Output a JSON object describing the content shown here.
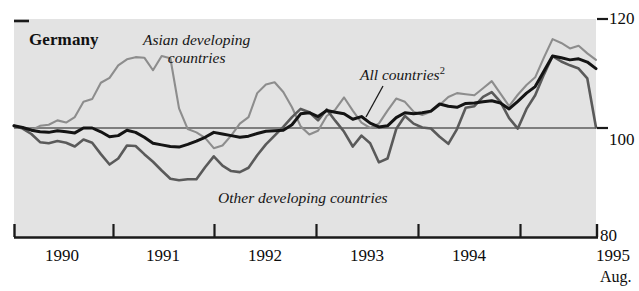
{
  "panel": {
    "title": "Germany"
  },
  "axes": {
    "y_ticks": [
      "120",
      "100",
      "80"
    ],
    "y_min": 80,
    "y_max": 120,
    "x_tick_labels": [
      "1990",
      "1991",
      "1992",
      "1993",
      "1994",
      "1995"
    ],
    "x_end_note": "Aug."
  },
  "labels": {
    "asian_line1": "Asian developing",
    "asian_line2": "countries",
    "all_countries": "All countries",
    "all_countries_footnote": "2",
    "other_developing": "Other developing countries"
  },
  "colors": {
    "plot_background": "#e3e3e3",
    "page_background": "#ffffff",
    "axis": "#1a1a1a",
    "asian_developing": "#8d8d8d",
    "other_developing": "#5a5a5a",
    "all_countries": "#141414"
  },
  "chart_data": {
    "type": "line",
    "title": "Germany",
    "xlabel": "",
    "ylabel": "",
    "ylim": [
      80,
      120
    ],
    "grid": false,
    "reference_line": 100,
    "legend": "inline-annotations",
    "x": [
      "1990-01",
      "1990-02",
      "1990-03",
      "1990-04",
      "1990-05",
      "1990-06",
      "1990-07",
      "1990-08",
      "1990-09",
      "1990-10",
      "1990-11",
      "1990-12",
      "1991-01",
      "1991-02",
      "1991-03",
      "1991-04",
      "1991-05",
      "1991-06",
      "1991-07",
      "1991-08",
      "1991-09",
      "1991-10",
      "1991-11",
      "1991-12",
      "1992-01",
      "1992-02",
      "1992-03",
      "1992-04",
      "1992-05",
      "1992-06",
      "1992-07",
      "1992-08",
      "1992-09",
      "1992-10",
      "1992-11",
      "1992-12",
      "1993-01",
      "1993-02",
      "1993-03",
      "1993-04",
      "1993-05",
      "1993-06",
      "1993-07",
      "1993-08",
      "1993-09",
      "1993-10",
      "1993-11",
      "1993-12",
      "1994-01",
      "1994-02",
      "1994-03",
      "1994-04",
      "1994-05",
      "1994-06",
      "1994-07",
      "1994-08",
      "1994-09",
      "1994-10",
      "1994-11",
      "1994-12",
      "1995-01",
      "1995-02",
      "1995-03",
      "1995-04",
      "1995-05",
      "1995-06",
      "1995-07",
      "1995-08"
    ],
    "series": [
      {
        "name": "Asian developing countries",
        "color": "#8d8d8d",
        "width": 2.1,
        "values": [
          100.3,
          100.0,
          99.6,
          100.4,
          100.6,
          101.4,
          101.0,
          102.0,
          104.8,
          105.3,
          108.3,
          109.2,
          111.5,
          112.6,
          113.0,
          112.9,
          110.6,
          113.2,
          112.8,
          103.6,
          99.8,
          99.2,
          98.2,
          96.3,
          96.8,
          98.6,
          100.8,
          102.0,
          106.4,
          108.0,
          108.4,
          106.6,
          103.8,
          100.3,
          98.8,
          99.5,
          102.2,
          103.4,
          105.6,
          103.2,
          101.0,
          100.0,
          100.8,
          103.2,
          105.4,
          104.8,
          103.0,
          102.4,
          103.0,
          104.2,
          105.7,
          106.4,
          106.2,
          106.0,
          107.3,
          108.6,
          106.3,
          104.0,
          106.1,
          107.9,
          109.3,
          112.9,
          116.3,
          115.6,
          114.6,
          115.1,
          113.7,
          112.5
        ]
      },
      {
        "name": "Other developing countries",
        "color": "#5a5a5a",
        "width": 2.6,
        "values": [
          100.4,
          99.9,
          98.9,
          97.4,
          97.2,
          97.6,
          97.3,
          96.6,
          97.9,
          97.3,
          95.2,
          93.3,
          94.4,
          96.8,
          96.7,
          95.2,
          93.8,
          92.2,
          90.7,
          90.4,
          90.6,
          90.6,
          92.8,
          94.8,
          93.1,
          92.1,
          91.9,
          92.7,
          95.0,
          97.0,
          98.6,
          100.2,
          102.0,
          103.5,
          102.9,
          101.4,
          103.4,
          101.3,
          99.3,
          96.6,
          98.6,
          97.2,
          93.7,
          94.4,
          99.8,
          102.2,
          100.8,
          100.1,
          99.9,
          98.4,
          97.1,
          99.8,
          103.7,
          104.0,
          105.7,
          106.6,
          104.8,
          101.8,
          99.9,
          103.5,
          106.0,
          109.8,
          113.2,
          112.2,
          111.5,
          110.9,
          109.1,
          100.1
        ]
      },
      {
        "name": "All countries",
        "color": "#141414",
        "width": 3.0,
        "values": [
          100.4,
          100.1,
          99.6,
          99.3,
          99.2,
          99.5,
          99.3,
          99.1,
          100.0,
          100.0,
          99.3,
          98.4,
          98.6,
          99.6,
          99.2,
          98.3,
          97.2,
          96.9,
          96.6,
          96.5,
          97.0,
          97.6,
          98.3,
          99.2,
          98.9,
          98.6,
          98.3,
          98.5,
          99.0,
          99.4,
          99.5,
          99.6,
          100.6,
          102.6,
          102.8,
          102.1,
          103.2,
          102.9,
          102.6,
          101.6,
          102.1,
          100.9,
          100.2,
          100.4,
          101.9,
          102.8,
          102.6,
          102.8,
          103.1,
          104.4,
          104.0,
          103.8,
          104.5,
          104.6,
          104.8,
          105.0,
          104.6,
          103.5,
          104.9,
          106.4,
          107.6,
          110.4,
          113.2,
          112.9,
          112.5,
          112.7,
          112.1,
          110.9
        ]
      }
    ]
  }
}
